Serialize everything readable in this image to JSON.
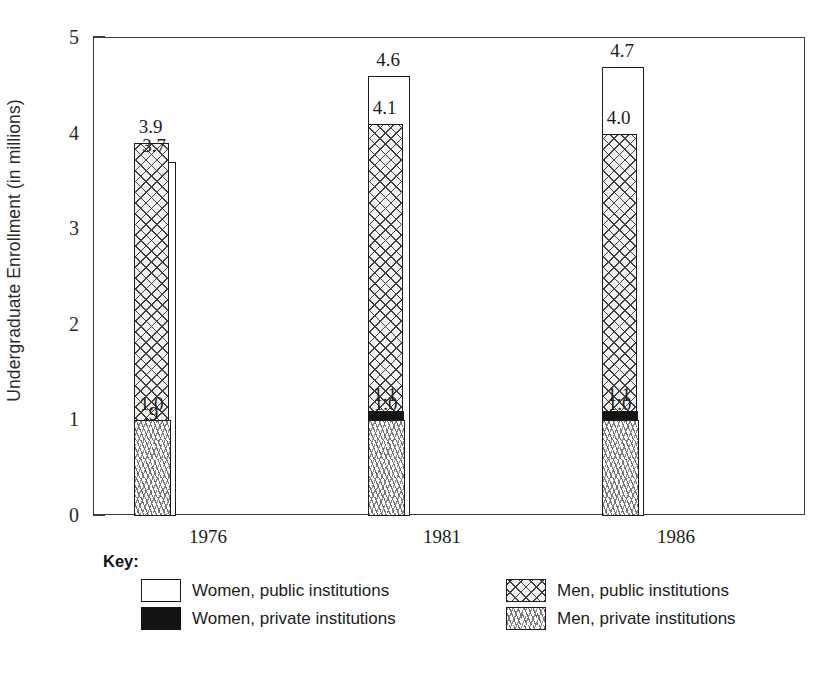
{
  "chart_data": {
    "type": "bar",
    "title": "",
    "xlabel": "",
    "ylabel": "Undergraduate Enrollment (in millions)",
    "ylim": [
      0,
      5
    ],
    "yticks": [
      "0",
      "1",
      "2",
      "3",
      "4",
      "5"
    ],
    "grid": false,
    "legend_position": "below-plot",
    "categories": [
      "1976",
      "1981",
      "1986"
    ],
    "series": [
      {
        "name": "Women, public institutions",
        "pattern": "white-open",
        "color": "#ffffff",
        "values": [
          3.7,
          4.1,
          4.7
        ],
        "labels": [
          "3.7",
          "4.6",
          "4.7"
        ]
      },
      {
        "name": "Men, public institutions",
        "pattern": "crosshatch",
        "color": "#f2f2f2",
        "values": [
          3.9,
          4.1,
          4.0
        ],
        "labels": [
          "3.9",
          "4.1",
          "4.0"
        ]
      },
      {
        "name": "Women, private institutions",
        "pattern": "solid-black",
        "color": "#141414",
        "values": [
          0.9,
          1.1,
          1.1
        ],
        "labels": [
          ".9",
          "1.1",
          "1.1"
        ]
      },
      {
        "name": "Men, private institutions",
        "pattern": "scattered-dashes",
        "color": "#fdfdfd",
        "values": [
          1.0,
          1.0,
          1.0
        ],
        "labels": [
          "1.0",
          "1.0",
          "1.0"
        ]
      }
    ],
    "bar_labels_by_group": [
      [
        "3.7",
        "3.9",
        ".9",
        "1.0"
      ],
      [
        "4.6",
        "4.1",
        "1.1",
        "1.0"
      ],
      [
        "4.7",
        "4.0",
        "1.1",
        "1.0"
      ]
    ],
    "bar_values_by_group": [
      [
        3.7,
        3.9,
        0.9,
        1.0
      ],
      [
        4.6,
        4.1,
        1.1,
        1.0
      ],
      [
        4.7,
        4.0,
        1.1,
        1.0
      ]
    ]
  },
  "legend": {
    "title": "Key:",
    "entries": [
      {
        "label": "Women, public institutions",
        "pattern": "women-public"
      },
      {
        "label": "Men, public institutions",
        "pattern": "men-public"
      },
      {
        "label": "Women, private institutions",
        "pattern": "women-private"
      },
      {
        "label": "Men, private institutions",
        "pattern": "men-private"
      }
    ]
  }
}
